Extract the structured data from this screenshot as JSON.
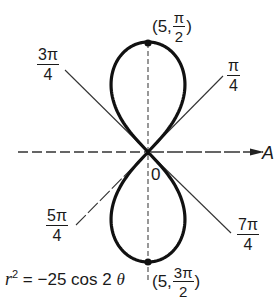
{
  "figure": {
    "type": "polar lemniscate plot",
    "equation": {
      "r_symbol": "r",
      "exponent": "2",
      "rhs": " = −25 cos 2 ",
      "theta": "θ"
    },
    "polar_axis_label": "A",
    "origin_label": "0",
    "angle_labels": [
      {
        "id": "pi_over_4",
        "numerator": "π",
        "denominator": "4"
      },
      {
        "id": "three_pi_over_4",
        "numerator": "3π",
        "denominator": "4"
      },
      {
        "id": "five_pi_over_4",
        "numerator": "5π",
        "denominator": "4"
      },
      {
        "id": "seven_pi_over_4",
        "numerator": "7π",
        "denominator": "4"
      }
    ],
    "points": [
      {
        "id": "top",
        "prefix": "(5,",
        "numerator": "π",
        "denominator": "2",
        "suffix": ")"
      },
      {
        "id": "bottom",
        "prefix": "(5,",
        "numerator": "3π",
        "denominator": "2",
        "suffix": ")"
      }
    ],
    "colors": {
      "curve": "#111111",
      "lines": "#333333",
      "background": "#ffffff"
    }
  }
}
